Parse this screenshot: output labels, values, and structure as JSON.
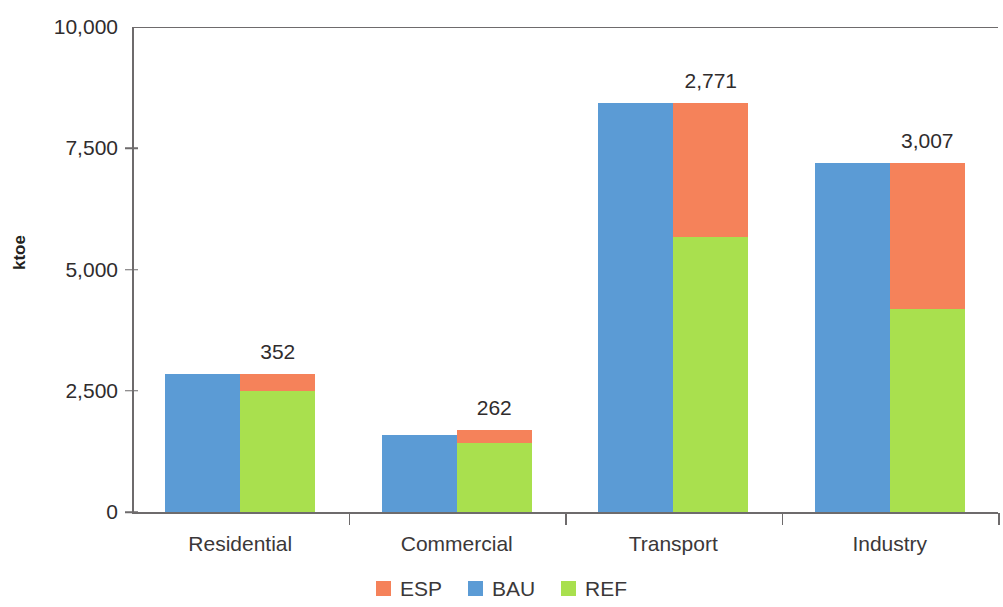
{
  "chart_data": {
    "type": "bar",
    "title": "",
    "subtitle": "",
    "xlabel": "",
    "ylabel": "ktoe",
    "ylim": [
      0,
      10000
    ],
    "ytick_values": [
      0,
      2500,
      5000,
      7500,
      10000
    ],
    "ytick_labels": [
      "0",
      "2,500",
      "5,000",
      "7,500",
      "10,000"
    ],
    "grid": false,
    "legend_position": "bottom-center",
    "stacked_pair": true,
    "categories": [
      "Residential",
      "Commercial",
      "Transport",
      "Industry"
    ],
    "series": [
      {
        "name": "BAU",
        "color": "#5b9bd5",
        "values": [
          2840,
          1590,
          8440,
          7190
        ]
      },
      {
        "name": "REF",
        "color": "#a9e04e",
        "values": [
          2488,
          1428,
          5669,
          4183
        ]
      },
      {
        "name": "ESP",
        "color": "#f5825a",
        "values": [
          352,
          262,
          2771,
          3007
        ]
      }
    ],
    "data_labels": [
      "352",
      "262",
      "2,771",
      "3,007"
    ],
    "data_label_note": "ESP savings value shown above each paired bar"
  },
  "axis": {
    "y_title": "ktoe",
    "y_ticks": [
      {
        "label": "10,000",
        "value": 10000
      },
      {
        "label": "7,500",
        "value": 7500
      },
      {
        "label": "5,000",
        "value": 5000
      },
      {
        "label": "2,500",
        "value": 2500
      },
      {
        "label": "0",
        "value": 0
      }
    ]
  },
  "categories": [
    {
      "label": "Residential",
      "bau": 2840,
      "ref": 2488,
      "esp": 352,
      "data_label": "352"
    },
    {
      "label": "Commercial",
      "bau": 1590,
      "ref": 1428,
      "esp": 262,
      "data_label": "262"
    },
    {
      "label": "Transport",
      "bau": 8440,
      "ref": 5669,
      "esp": 2771,
      "data_label": "2,771"
    },
    {
      "label": "Industry",
      "bau": 7190,
      "ref": 4183,
      "esp": 3007,
      "data_label": "3,007"
    }
  ],
  "legend": {
    "items": [
      {
        "label": "ESP",
        "color": "#f5825a"
      },
      {
        "label": "BAU",
        "color": "#5b9bd5"
      },
      {
        "label": "REF",
        "color": "#a9e04e"
      }
    ]
  },
  "colors": {
    "esp": "#f5825a",
    "bau": "#5b9bd5",
    "ref": "#a9e04e",
    "axis": "#6e6b6c",
    "text": "#2f2c2d",
    "background": "#ffffff"
  }
}
